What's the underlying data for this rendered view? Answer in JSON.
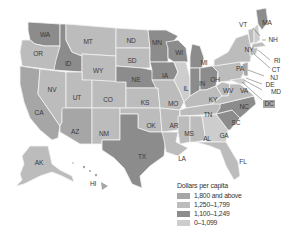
{
  "legend": {
    "title": "Dollars per capita",
    "items": [
      {
        "label": "1,800 and above",
        "color": "#a6a6a6"
      },
      {
        "label": "1,250–1,799",
        "color": "#bcbcbc"
      },
      {
        "label": "1,100–1,249",
        "color": "#8c8c8c"
      },
      {
        "label": "0–1,099",
        "color": "#cdcdcd"
      }
    ]
  },
  "states": {
    "WA": "WA",
    "OR": "OR",
    "CA": "CA",
    "ID": "ID",
    "NV": "NV",
    "MT": "MT",
    "WY": "WY",
    "UT": "UT",
    "AZ": "AZ",
    "CO": "CO",
    "NM": "NM",
    "ND": "ND",
    "SD": "SD",
    "NE": "NE",
    "KS": "KS",
    "OK": "OK",
    "TX": "TX",
    "MN": "MN",
    "IA": "IA",
    "MO": "MO",
    "AR": "AR",
    "LA": "LA",
    "WI": "WI",
    "IL": "IL",
    "MS": "MS",
    "MI": "MI",
    "IN": "IN",
    "KY": "KY",
    "TN": "TN",
    "AL": "AL",
    "OH": "OH",
    "WV": "WV",
    "GA": "GA",
    "FL": "FL",
    "SC": "SC",
    "NC": "NC",
    "VA": "VA",
    "PA": "PA",
    "NY": "NY",
    "VT": "VT",
    "NH": "NH",
    "MA": "MA",
    "RI": "RI",
    "CT": "CT",
    "NJ": "NJ",
    "DE": "DE",
    "MD": "MD",
    "DC": "DC",
    "AK": "AK",
    "HI": "HI"
  }
}
